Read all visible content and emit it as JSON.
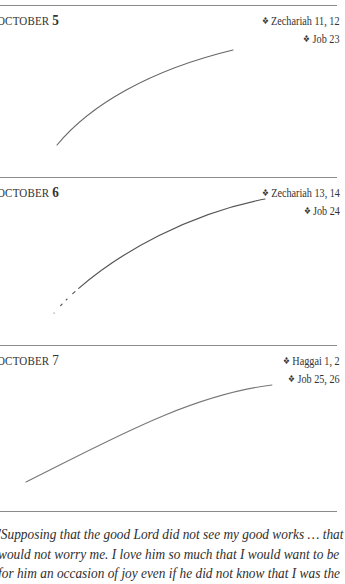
{
  "entries": [
    {
      "month": "OCTOBER",
      "day": "5",
      "readings": [
        "Zechariah 11, 12",
        "Job 23"
      ],
      "stroke_path": "M57,145 C 90,105 150,70 233,50"
    },
    {
      "month": "OCTOBER",
      "day": "6",
      "readings": [
        "Zechariah 13, 14",
        "Job 24"
      ],
      "stroke_path": "M54,313 C 95,265 180,215 265,199"
    },
    {
      "month": "OCTOBER",
      "day": "7",
      "readings": [
        "Haggai 1, 2",
        "Job 25, 26"
      ],
      "stroke_path": "M26,482 C 110,440 190,395 272,385"
    }
  ],
  "bullet": "❖",
  "quote": {
    "lines": [
      "'Supposing that the good Lord did not see my good works … that",
      "would not worry me. I love him so much that I would want to be",
      "for him an occasion of joy even if he did not know that I was the"
    ]
  },
  "colors": {
    "rule": "#8a8a8a",
    "ink": "#555555"
  }
}
